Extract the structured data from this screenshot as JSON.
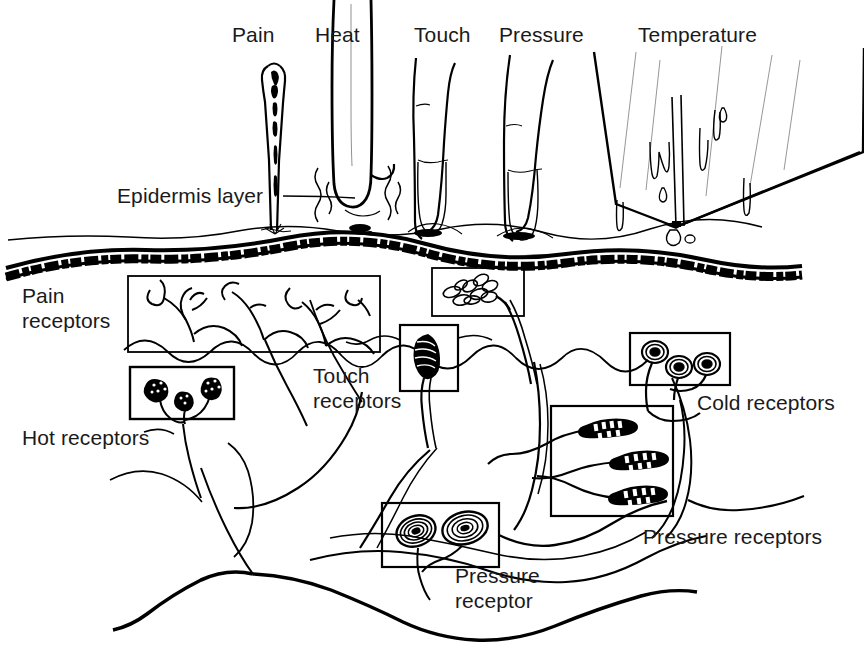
{
  "figure": {
    "style": "black-and-white line drawing",
    "width": 864,
    "height": 654,
    "ink_color": "#000000",
    "background_color": "#ffffff",
    "text_color": "#1a1a1a"
  },
  "stimulus_labels": [
    {
      "id": "pain",
      "text": "Pain",
      "x": 232,
      "y": 22
    },
    {
      "id": "heat",
      "text": "Heat",
      "x": 315,
      "y": 22
    },
    {
      "id": "touch",
      "text": "Touch",
      "x": 414,
      "y": 22
    },
    {
      "id": "pressure",
      "text": "Pressure",
      "x": 499,
      "y": 22
    },
    {
      "id": "temperature",
      "text": "Temperature",
      "x": 638,
      "y": 22
    }
  ],
  "structure_labels": [
    {
      "id": "epidermis-layer",
      "text": "Epidermis layer",
      "x": 117,
      "y": 183
    },
    {
      "id": "pain-receptors",
      "text": "Pain\nreceptors",
      "x": 22,
      "y": 283
    },
    {
      "id": "hot-receptors",
      "text": "Hot receptors",
      "x": 22,
      "y": 425
    },
    {
      "id": "touch-receptors",
      "text": "Touch\nreceptors",
      "x": 313,
      "y": 363
    },
    {
      "id": "cold-receptors",
      "text": "Cold receptors",
      "x": 697,
      "y": 390
    },
    {
      "id": "pressure-receptors",
      "text": "Pressure receptors",
      "x": 643,
      "y": 524
    },
    {
      "id": "pressure-receptor",
      "text": "Pressure\nreceptor",
      "x": 455,
      "y": 563
    }
  ],
  "stimulus_objects": [
    {
      "id": "needle",
      "name": "needle",
      "stimulus": "Pain"
    },
    {
      "id": "hot-rod",
      "name": "hot metal rod with heat waves",
      "stimulus": "Heat"
    },
    {
      "id": "finger-touch",
      "name": "finger pressing lightly",
      "stimulus": "Touch"
    },
    {
      "id": "finger-pressure",
      "name": "finger pressing firmly",
      "stimulus": "Pressure"
    },
    {
      "id": "ice-cube",
      "name": "melting ice cube with water droplets",
      "stimulus": "Temperature"
    }
  ],
  "receptor_groups": [
    {
      "id": "pain-receptor-box",
      "label": "Pain receptors",
      "receptor_type": "free nerve endings",
      "count": 4
    },
    {
      "id": "hot-receptor-box",
      "label": "Hot receptors",
      "receptor_type": "Ruffini end organs",
      "count": 3
    },
    {
      "id": "merkel-disc-box",
      "label": "Touch receptors",
      "receptor_type": "Merkel discs",
      "count": 9
    },
    {
      "id": "touch-receptor-box",
      "label": "Touch receptors",
      "receptor_type": "Meissner corpuscle",
      "count": 1
    },
    {
      "id": "cold-receptor-box",
      "label": "Cold receptors",
      "receptor_type": "Krause end bulbs",
      "count": 3
    },
    {
      "id": "pressure-receptor-box-right",
      "label": "Pressure receptors",
      "receptor_type": "elongated corpuscles",
      "count": 3
    },
    {
      "id": "pressure-receptor-box-lower",
      "label": "Pressure receptor",
      "receptor_type": "Pacinian corpuscles",
      "count": 2
    }
  ],
  "skin_layers": [
    {
      "id": "skin-surface-line",
      "name": "skin surface"
    },
    {
      "id": "epidermis-band",
      "name": "epidermis dark band"
    },
    {
      "id": "dermis",
      "name": "dermis region"
    },
    {
      "id": "subcutaneous",
      "name": "subcutaneous nerve trunks"
    }
  ]
}
